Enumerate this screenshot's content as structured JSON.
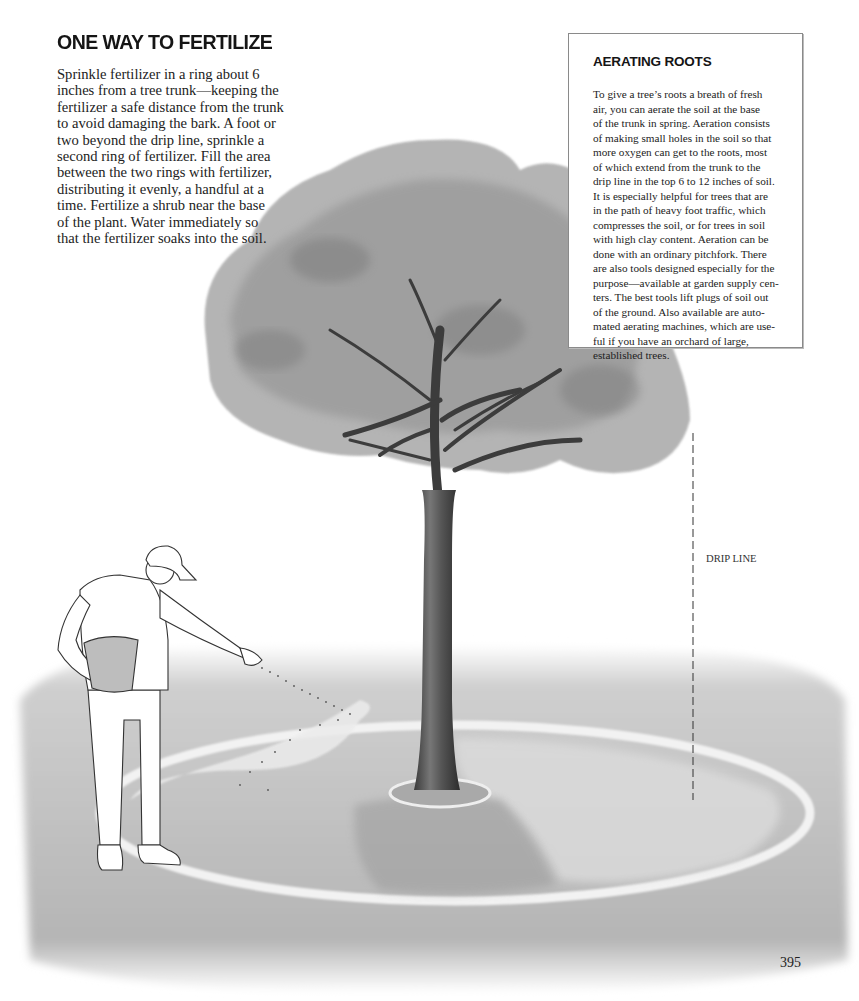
{
  "article": {
    "title": "ONE WAY TO FERTILIZE",
    "body_lines": [
      "Sprinkle fertilizer in a ring about 6",
      "inches from a tree trunk—keeping the",
      "fertilizer a safe distance from the trunk",
      "to avoid damaging the bark. A foot or",
      "two beyond the drip line, sprinkle a",
      "second ring of fertilizer. Fill the area",
      "between the two rings with fertilizer,",
      "distributing it evenly, a handful at a",
      "time. Fertilize a shrub near the base",
      "of the plant. Water immediately so",
      "that the fertilizer soaks into the soil."
    ]
  },
  "sidebar": {
    "title": "AERATING ROOTS",
    "body_lines": [
      "To give a tree’s roots a breath of fresh",
      "air, you can aerate the soil at the base",
      "of the trunk in spring. Aeration consists",
      "of making small holes in the soil so that",
      "more oxygen can get to the roots, most",
      "of which extend from the trunk to the",
      "drip line in the top 6 to 12 inches of soil.",
      "It is especially helpful for trees that are",
      "in the path of heavy foot traffic, which",
      "compresses the soil, or for trees in soil",
      "with high clay content. Aeration can be",
      "done with an ordinary pitchfork. There",
      "are also tools designed especially for the",
      "purpose—available at garden supply cen-",
      "ters. The best tools lift plugs of soil out",
      "of the ground. Also available are auto-",
      "mated aerating machines, which are use-",
      "ful if you have an orchard of large,",
      "established trees."
    ]
  },
  "illustration": {
    "drip_line_label": "DRIP LINE",
    "description": "Man in cap sprinkling fertilizer from a bucket in two rings around a tree"
  },
  "page_number": "395"
}
